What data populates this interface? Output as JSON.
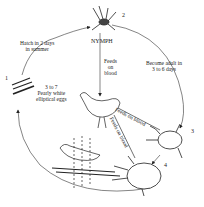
{
  "diagram": {
    "stages": [
      {
        "number": "1",
        "name": "eggs",
        "description_lines": [
          "3 to 7",
          "Pearly white",
          "elliptical eggs"
        ]
      },
      {
        "number": "2",
        "name": "NYMPH"
      },
      {
        "number": "3",
        "name": "adult"
      },
      {
        "number": "4",
        "name": "engorged adult"
      }
    ],
    "transitions": [
      {
        "from": "1",
        "to": "2",
        "lines": [
          "Hatch in 2 days",
          "in summer"
        ]
      },
      {
        "from": "2",
        "to": "3",
        "lines": [
          "Become adult in",
          "3 to 6 days"
        ]
      },
      {
        "from": "2",
        "to": "host",
        "lines": [
          "Feeds",
          "on",
          "blood"
        ]
      },
      {
        "from": "3",
        "to": "host",
        "label": "Feeds on blood"
      },
      {
        "from": "4",
        "to": "host",
        "label": "Feeds on blood"
      }
    ],
    "hosts": [
      "chicken",
      "bird on perch"
    ],
    "colors": {
      "ink": "#222222",
      "background": "#ffffff"
    }
  }
}
